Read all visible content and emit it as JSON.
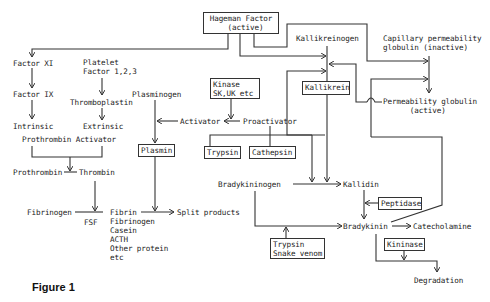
{
  "figure": {
    "caption": "Figure 1",
    "nodes": {
      "hageman": "Hageman Factor\n  (active)",
      "factor_xi": "Factor XI",
      "factor_ix": "Factor IX",
      "intrinsic": "Intrinsic",
      "platelet": "Platelet\nFactor 1,2,3",
      "thromboplastin": "Thromboplastin",
      "extrinsic": "Extrinsic",
      "prothrombin_activator": "Prothrombin Activator",
      "prothrombin": "Prothrombin",
      "thrombin": "Thrombin",
      "fibrinogen": "Fibrinogen",
      "fsf": "FSF",
      "substrates": "Fibrin\nFibrinogen\nCasein\nACTH\nOther protein\netc",
      "split_products": "Split products",
      "plasminogen": "Plasminogen",
      "activator": "Activator",
      "proactivator": "Proactivator",
      "kinase": "Kinase\nSK,UK etc",
      "plasmin": "Plasmin",
      "trypsin": "Trypsin",
      "cathepsin": "Cathepsin",
      "kallikreinogen": "Kallikreinogen",
      "kallikrein": "Kallikrein",
      "capillary_globulin": "Capillary permeability\nglobulin (inactive)",
      "permeability_globulin": "Permeability globulin\n      (active)",
      "bradykininogen": "Bradykininogen",
      "kallidin": "Kallidin",
      "peptidase": "Peptidase",
      "bradykinin": "Bradykinin",
      "catecholamine": "Catecholamine",
      "kininase": "Kininase",
      "degradation": "Degradation",
      "trypsin_venom": "Trypsin\nSnake venom"
    }
  }
}
